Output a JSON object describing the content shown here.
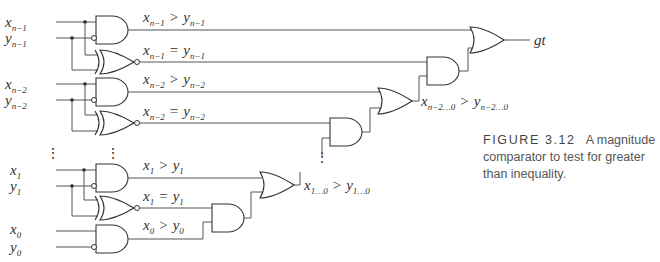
{
  "diagram": {
    "type": "logic-circuit",
    "inputs": {
      "x_n1": {
        "base": "x",
        "sub": "n−1"
      },
      "y_n1": {
        "base": "y",
        "sub": "n−1"
      },
      "x_n2": {
        "base": "x",
        "sub": "n−2"
      },
      "y_n2": {
        "base": "y",
        "sub": "n−2"
      },
      "x_1": {
        "base": "x",
        "sub": "1"
      },
      "y_1": {
        "base": "y",
        "sub": "1"
      },
      "x_0": {
        "base": "x",
        "sub": "0"
      },
      "y_0": {
        "base": "y",
        "sub": "0"
      }
    },
    "wire_labels": {
      "gt_n1": {
        "lx": "x",
        "lsub": "n−1",
        "op": ">",
        "ry": "y",
        "rsub": "n−1"
      },
      "eq_n1": {
        "lx": "x",
        "lsub": "n−1",
        "op": "=",
        "ry": "y",
        "rsub": "n−1"
      },
      "gt_n2": {
        "lx": "x",
        "lsub": "n−2",
        "op": ">",
        "ry": "y",
        "rsub": "n−2"
      },
      "eq_n2": {
        "lx": "x",
        "lsub": "n−2",
        "op": "=",
        "ry": "y",
        "rsub": "n−2"
      },
      "gt_1": {
        "lx": "x",
        "lsub": "1",
        "op": ">",
        "ry": "y",
        "rsub": "1"
      },
      "eq_1": {
        "lx": "x",
        "lsub": "1",
        "op": "=",
        "ry": "y",
        "rsub": "1"
      },
      "gt_0": {
        "lx": "x",
        "lsub": "0",
        "op": ">",
        "ry": "y",
        "rsub": "0"
      },
      "gt_n2_0": {
        "lx": "x",
        "lsub": "n−2…0",
        "op": ">",
        "ry": "y",
        "rsub": "n−2…0"
      },
      "gt_1_0": {
        "lx": "x",
        "lsub": "1…0",
        "op": ">",
        "ry": "y",
        "rsub": "1…0"
      }
    },
    "output": {
      "label": "gt"
    },
    "ellipsis": "⋮",
    "gates": [
      "AND",
      "XNOR",
      "AND",
      "XNOR",
      "AND",
      "XNOR",
      "AND",
      "OR",
      "AND",
      "OR",
      "AND",
      "OR",
      "AND",
      "OR"
    ]
  },
  "caption": {
    "figure": "FIGURE 3.12",
    "text": "A magnitude comparator to test for greater than inequality."
  }
}
